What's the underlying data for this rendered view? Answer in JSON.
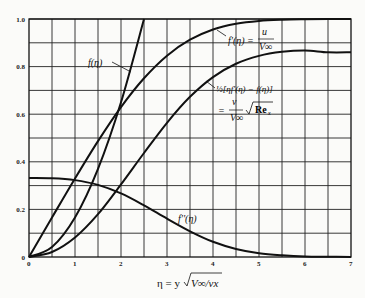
{
  "chart_data": {
    "type": "line",
    "title": "",
    "xlabel": "η = y√(V∞/νx)",
    "ylabel": "",
    "xlim": [
      0,
      7
    ],
    "ylim": [
      0,
      1.0
    ],
    "grid": true,
    "x_ticks": [
      "0",
      "1",
      "2",
      "3",
      "4",
      "5",
      "6",
      "7"
    ],
    "y_ticks": [
      "0",
      "0.2",
      "0.4",
      "0.6",
      "0.8",
      "1.0"
    ],
    "x": [
      0,
      0.5,
      1,
      1.5,
      2,
      2.5,
      3,
      3.5,
      4,
      4.5,
      5,
      5.5,
      6,
      6.5,
      7
    ],
    "series": [
      {
        "name": "f(η)",
        "label": "f(η)",
        "values": [
          0,
          0.042,
          0.166,
          0.37,
          0.65,
          1.0,
          null,
          null,
          null,
          null,
          null,
          null,
          null,
          null,
          null
        ]
      },
      {
        "name": "f'(η) = u/V∞",
        "label_main": "f'(η) =",
        "label_num": "u",
        "label_den": "V∞",
        "values": [
          0,
          0.166,
          0.33,
          0.487,
          0.63,
          0.751,
          0.846,
          0.913,
          0.956,
          0.98,
          0.992,
          0.997,
          0.999,
          1.0,
          1.0
        ]
      },
      {
        "name": "½[ηf'(η) − f(η)] = (v/V∞)√Re_x",
        "label_line1": "½[ηf'(η) − f(η)]",
        "label_eq": "=",
        "label_num": "v",
        "label_den": "V∞",
        "label_root": "Re",
        "label_sub": "x",
        "values": [
          0,
          0.021,
          0.082,
          0.18,
          0.305,
          0.437,
          0.564,
          0.673,
          0.756,
          0.812,
          0.845,
          0.862,
          0.868,
          0.86,
          0.86
        ]
      },
      {
        "name": "f''(η)",
        "label": "f''(η)",
        "values": [
          0.332,
          0.331,
          0.323,
          0.303,
          0.267,
          0.217,
          0.161,
          0.108,
          0.064,
          0.034,
          0.016,
          0.007,
          0.002,
          0.001,
          0.0
        ]
      }
    ],
    "legend": "inline labels"
  }
}
